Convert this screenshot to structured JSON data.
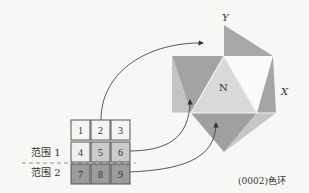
{
  "figure": {
    "axis_labels": {
      "y": "Y",
      "x": "X",
      "center": "N"
    },
    "caption": "(0002)色环",
    "range_labels": {
      "range1": "范围 1",
      "range2": "范围 2"
    },
    "grid": {
      "cells": [
        {
          "label": "1",
          "shade": "#f4f4f2"
        },
        {
          "label": "2",
          "shade": "#f4f4f2"
        },
        {
          "label": "3",
          "shade": "#f4f4f2"
        },
        {
          "label": "4",
          "shade": "#f0f0ee"
        },
        {
          "label": "5",
          "shade": "#c9c9c7"
        },
        {
          "label": "6",
          "shade": "#c9c9c7"
        },
        {
          "label": "7",
          "shade": "#9a9a98"
        },
        {
          "label": "8",
          "shade": "#9a9a98"
        },
        {
          "label": "9",
          "shade": "#9a9a98"
        }
      ]
    },
    "colors": {
      "dark": "#a3a3a1",
      "mid": "#bdbdbb",
      "light": "#d6d6d4",
      "white": "#fafaf8",
      "line": "#555555"
    }
  }
}
